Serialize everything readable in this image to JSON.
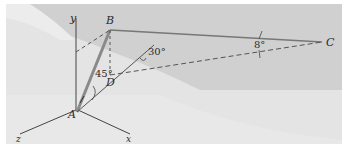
{
  "figure": {
    "type": "statics-3d-diagram",
    "background_colors": {
      "upper": "#cfcfcf",
      "lower": "#e3e3e3",
      "light": "#efefef"
    },
    "line_color": "#555555",
    "rod_color": "#8a8a8a"
  },
  "axes": {
    "y": "y",
    "z": "z",
    "x": "x"
  },
  "points": {
    "A": "A",
    "B": "B",
    "C": "C",
    "D": "D"
  },
  "angles": {
    "BAD": "45°",
    "D_to_axis": "30°",
    "BCD": "8°"
  }
}
